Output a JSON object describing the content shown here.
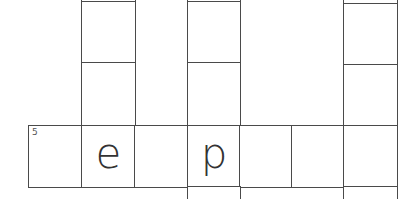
{
  "puzzle": {
    "type": "crossword",
    "clue_number": "5",
    "row5_letters": [
      "",
      "e",
      "",
      "p",
      "",
      "",
      ""
    ],
    "colors": {
      "line": "#4a4a4a",
      "letter": "#333333",
      "background": "#ffffff"
    }
  }
}
